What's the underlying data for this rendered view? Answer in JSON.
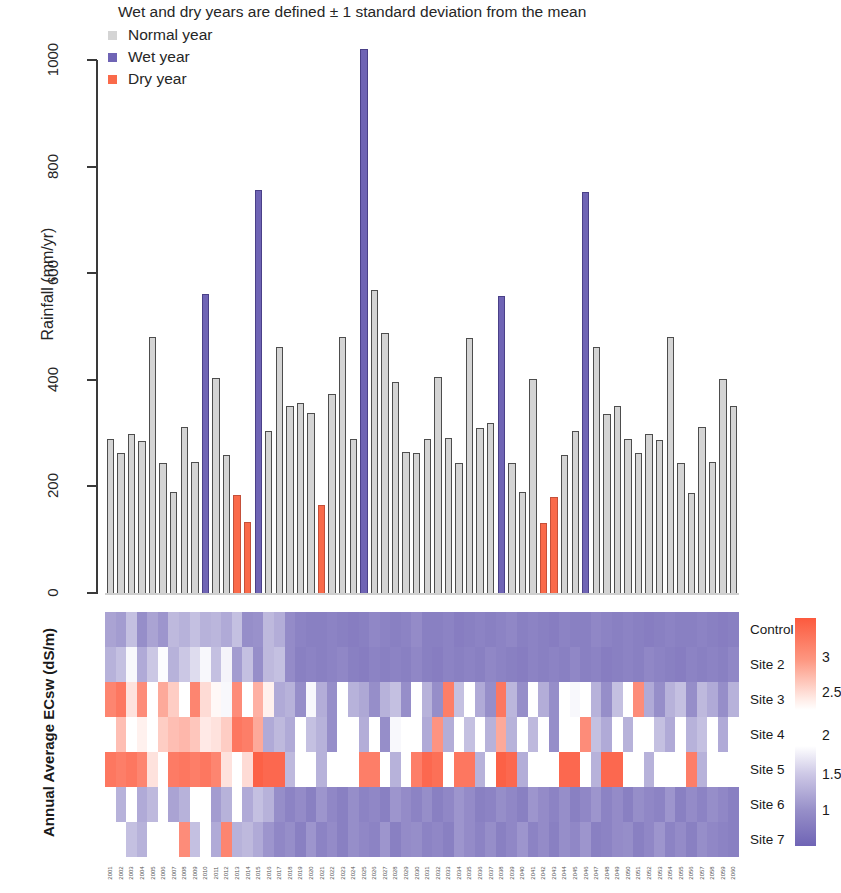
{
  "chart_data": [
    {
      "type": "bar",
      "title": "Wet and dry years are defined ± 1 standard deviation from the mean",
      "xlabel": "",
      "ylabel": "Rainfall (mm/yr)",
      "ylim": [
        0,
        1050
      ],
      "yticks": [
        0,
        200,
        400,
        600,
        800,
        1000
      ],
      "grid": false,
      "legend_position": "top-left",
      "legend": [
        {
          "label": "Normal year",
          "color": "#d4d4d4",
          "key": "normal"
        },
        {
          "label": "Wet year",
          "color": "#6f64b5",
          "key": "wet"
        },
        {
          "label": "Dry year",
          "color": "#fa6a4a",
          "key": "dry"
        }
      ],
      "categories": [
        "2001",
        "2002",
        "2003",
        "2004",
        "2005",
        "2006",
        "2007",
        "2008",
        "2009",
        "2010",
        "2011",
        "2012",
        "2013",
        "2014",
        "2015",
        "2016",
        "2017",
        "2018",
        "2019",
        "2020",
        "2021",
        "2022",
        "2023",
        "2024",
        "2025",
        "2026",
        "2027",
        "2028",
        "2029",
        "2030",
        "2031",
        "2032",
        "2033",
        "2034",
        "2035",
        "2036",
        "2037",
        "2038",
        "2039",
        "2040",
        "2041",
        "2042",
        "2043",
        "2044",
        "2045",
        "2046",
        "2047",
        "2048",
        "2049",
        "2050",
        "2051",
        "2052",
        "2053",
        "2054",
        "2055",
        "2056",
        "2057",
        "2058",
        "2059",
        "2060"
      ],
      "values": [
        291,
        264,
        300,
        288,
        482,
        246,
        191,
        313,
        247,
        563,
        405,
        261,
        185,
        136,
        758,
        306,
        464,
        352,
        358,
        340,
        167,
        376,
        483,
        291,
        1022,
        571,
        489,
        398,
        266,
        265,
        291,
        407,
        292,
        245,
        480,
        311,
        320,
        560,
        246,
        191,
        404,
        134,
        182,
        260,
        305,
        755,
        464,
        338,
        353,
        291,
        265,
        300,
        289,
        482,
        246,
        190,
        313,
        247,
        404,
        352
      ],
      "bar_types": [
        "normal",
        "normal",
        "normal",
        "normal",
        "normal",
        "normal",
        "normal",
        "normal",
        "normal",
        "wet",
        "normal",
        "normal",
        "dry",
        "dry",
        "wet",
        "normal",
        "normal",
        "normal",
        "normal",
        "normal",
        "dry",
        "normal",
        "normal",
        "normal",
        "wet",
        "normal",
        "normal",
        "normal",
        "normal",
        "normal",
        "normal",
        "normal",
        "normal",
        "normal",
        "normal",
        "normal",
        "normal",
        "wet",
        "normal",
        "normal",
        "normal",
        "dry",
        "dry",
        "normal",
        "normal",
        "wet",
        "normal",
        "normal",
        "normal",
        "normal",
        "normal",
        "normal",
        "normal",
        "normal",
        "normal",
        "normal",
        "normal",
        "normal",
        "normal",
        "normal"
      ]
    },
    {
      "type": "heatmap",
      "title": "",
      "ylabel": "Annual Average ECsw (dS/m)",
      "row_labels": [
        "Control",
        "Site 2",
        "Site 3",
        "Site 4",
        "Site 5",
        "Site 6",
        "Site 7"
      ],
      "colorbar_ticks": [
        "3",
        "2.5",
        "2",
        "1.5",
        "1"
      ],
      "colorbar_range": [
        0.8,
        3.3
      ],
      "colorbar_colors": {
        "high": "#fc6a4a",
        "mid": "#ffffff",
        "low": "#6f64b5"
      },
      "columns": [
        "2001",
        "2002",
        "2003",
        "2004",
        "2005",
        "2006",
        "2007",
        "2008",
        "2009",
        "2010",
        "2011",
        "2012",
        "2013",
        "2014",
        "2015",
        "2016",
        "2017",
        "2018",
        "2019",
        "2020",
        "2021",
        "2022",
        "2023",
        "2024",
        "2025",
        "2026",
        "2027",
        "2028",
        "2029",
        "2030",
        "2031",
        "2032",
        "2033",
        "2034",
        "2035",
        "2036",
        "2037",
        "2038",
        "2039",
        "2040",
        "2041",
        "2042",
        "2043",
        "2044",
        "2045",
        "2046",
        "2047",
        "2048",
        "2049",
        "2050",
        "2051",
        "2052",
        "2053",
        "2054",
        "2055",
        "2056",
        "2057",
        "2058",
        "2059",
        "2060"
      ],
      "rows": [
        {
          "label": "Control",
          "values": [
            1.35,
            1.3,
            1.55,
            1.2,
            1.35,
            1.25,
            1.5,
            1.45,
            1.55,
            1.45,
            1.48,
            1.4,
            1.55,
            1.2,
            1.22,
            1.5,
            1.42,
            1.18,
            1.12,
            1.1,
            1.1,
            1.12,
            1.1,
            1.08,
            1.1,
            1.15,
            1.12,
            1.1,
            1.12,
            1.18,
            1.1,
            1.1,
            1.12,
            1.08,
            1.1,
            1.12,
            1.1,
            1.12,
            1.15,
            1.1,
            1.12,
            1.1,
            1.08,
            1.12,
            1.1,
            1.1,
            1.15,
            1.12,
            1.1,
            1.12,
            1.1,
            1.08,
            1.1,
            1.12,
            1.1,
            1.1,
            1.12,
            1.1,
            1.08,
            1.1
          ]
        },
        {
          "label": "Site 2",
          "values": [
            1.45,
            1.55,
            1.95,
            1.4,
            1.6,
            1.98,
            1.45,
            1.6,
            1.75,
            1.95,
            1.55,
            1.92,
            1.3,
            1.55,
            1.2,
            1.5,
            1.55,
            1.18,
            1.1,
            1.12,
            1.1,
            1.12,
            1.15,
            1.1,
            1.08,
            1.12,
            1.1,
            1.12,
            1.1,
            1.15,
            1.1,
            1.08,
            1.12,
            1.1,
            1.12,
            1.1,
            1.15,
            1.12,
            1.1,
            1.08,
            1.12,
            1.1,
            1.12,
            1.1,
            1.15,
            1.1,
            1.12,
            1.08,
            1.1,
            1.12,
            1.1,
            1.15,
            1.12,
            1.1,
            1.08,
            1.12,
            1.1,
            1.12,
            1.1,
            1.15
          ]
        },
        {
          "label": "Site 3",
          "values": [
            2.85,
            2.95,
            2.2,
            2.8,
            2.0,
            2.6,
            2.35,
            2.0,
            2.85,
            2.25,
            2.05,
            1.95,
            2.8,
            2.0,
            2.55,
            2.1,
            1.4,
            1.45,
            1.2,
            1.95,
            1.42,
            1.2,
            2.0,
            1.45,
            1.38,
            1.2,
            1.45,
            1.55,
            1.2,
            2.0,
            1.45,
            1.2,
            2.9,
            1.55,
            2.0,
            1.4,
            1.2,
            2.95,
            1.48,
            1.2,
            2.0,
            1.42,
            1.2,
            2.0,
            1.95,
            2.0,
            1.45,
            1.2,
            1.55,
            2.0,
            2.8,
            1.4,
            1.2,
            1.45,
            1.55,
            1.2,
            1.5,
            1.4,
            1.2,
            1.45
          ]
        },
        {
          "label": "Site 4",
          "values": [
            2.0,
            2.45,
            2.0,
            2.1,
            2.0,
            2.35,
            2.45,
            2.5,
            2.4,
            2.15,
            2.2,
            2.35,
            2.95,
            2.9,
            2.6,
            1.4,
            1.5,
            1.4,
            2.0,
            1.55,
            1.45,
            1.2,
            2.0,
            2.0,
            1.42,
            2.0,
            1.2,
            1.95,
            2.0,
            2.0,
            1.4,
            2.75,
            1.42,
            2.0,
            1.55,
            2.0,
            1.45,
            2.6,
            1.45,
            2.0,
            1.5,
            2.0,
            1.2,
            2.0,
            2.0,
            2.8,
            1.55,
            1.4,
            2.0,
            1.45,
            2.0,
            2.0,
            1.55,
            1.4,
            2.0,
            1.45,
            1.55,
            2.0,
            1.4,
            2.0
          ]
        },
        {
          "label": "Site 5",
          "values": [
            2.95,
            2.9,
            2.95,
            2.85,
            2.2,
            2.0,
            2.92,
            2.95,
            2.9,
            2.95,
            2.85,
            2.2,
            2.0,
            2.25,
            3.1,
            3.05,
            3.05,
            1.5,
            2.0,
            2.0,
            1.45,
            2.0,
            2.0,
            2.0,
            2.9,
            2.9,
            2.0,
            1.45,
            2.0,
            2.9,
            3.05,
            3.0,
            2.0,
            2.95,
            2.95,
            1.45,
            2.0,
            3.1,
            3.05,
            1.42,
            2.0,
            2.0,
            2.0,
            3.05,
            3.05,
            2.0,
            1.45,
            3.05,
            3.05,
            2.0,
            2.0,
            1.45,
            2.0,
            2.0,
            2.0,
            2.9,
            1.45,
            2.0,
            2.0,
            2.0
          ]
        },
        {
          "label": "Site 6",
          "values": [
            2.0,
            1.45,
            2.0,
            1.4,
            1.5,
            2.0,
            1.35,
            1.45,
            2.0,
            2.0,
            1.3,
            1.45,
            2.0,
            1.4,
            1.55,
            1.45,
            1.2,
            1.12,
            1.18,
            1.1,
            1.25,
            1.15,
            1.1,
            1.2,
            1.12,
            1.15,
            1.1,
            1.25,
            1.18,
            1.12,
            1.2,
            1.1,
            1.15,
            1.25,
            1.18,
            1.1,
            1.12,
            1.2,
            1.15,
            1.1,
            1.25,
            1.18,
            1.12,
            1.2,
            1.1,
            1.15,
            1.25,
            1.12,
            1.18,
            1.1,
            1.2,
            1.15,
            1.12,
            1.25,
            1.1,
            1.18,
            1.12,
            1.2,
            1.15,
            1.1
          ]
        },
        {
          "label": "Site 7",
          "values": [
            2.0,
            2.0,
            1.55,
            1.45,
            2.0,
            2.0,
            2.0,
            2.8,
            1.55,
            2.0,
            1.4,
            2.85,
            1.45,
            1.5,
            1.4,
            1.25,
            1.15,
            1.2,
            1.1,
            1.25,
            1.12,
            1.18,
            1.1,
            1.2,
            1.15,
            1.12,
            1.25,
            1.1,
            1.18,
            1.2,
            1.12,
            1.15,
            1.1,
            1.25,
            1.18,
            1.12,
            1.2,
            1.1,
            1.15,
            1.25,
            1.12,
            1.18,
            1.1,
            1.2,
            1.15,
            1.25,
            1.1,
            1.12,
            1.18,
            1.2,
            1.1,
            1.15,
            1.25,
            1.12,
            1.18,
            1.1,
            1.2,
            1.15,
            1.12,
            1.1
          ]
        }
      ]
    }
  ]
}
